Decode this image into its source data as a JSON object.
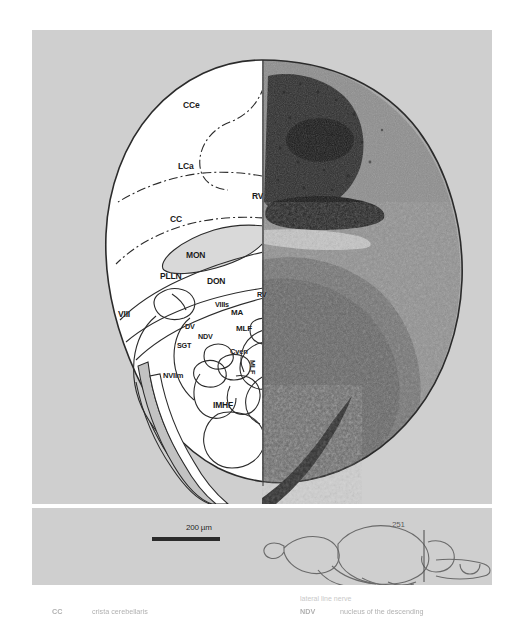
{
  "figure": {
    "panel_bg": "#cfcfcf",
    "page_bg": "#ffffff",
    "outline_color": "#2b2b2b",
    "traced_fill": "#ffffff",
    "histology_dark": "#4a4a4a"
  },
  "section_labels": [
    {
      "id": "CCe",
      "text": "CCe",
      "x": 183,
      "y": 101,
      "size": 8.5,
      "rotate": 0
    },
    {
      "id": "LCa",
      "text": "LCa",
      "x": 178,
      "y": 162,
      "size": 8.5,
      "rotate": 0
    },
    {
      "id": "RV1",
      "text": "RV",
      "x": 252,
      "y": 192,
      "size": 8.5,
      "rotate": 0
    },
    {
      "id": "CC",
      "text": "CC",
      "x": 170,
      "y": 215,
      "size": 8.5,
      "rotate": 0
    },
    {
      "id": "MON",
      "text": "MON",
      "x": 186,
      "y": 251,
      "size": 8.5,
      "rotate": 0
    },
    {
      "id": "PLLN",
      "text": "PLLN",
      "x": 160,
      "y": 272,
      "size": 8.5,
      "rotate": 0
    },
    {
      "id": "DON",
      "text": "DON",
      "x": 207,
      "y": 277,
      "size": 8.5,
      "rotate": 0
    },
    {
      "id": "VIII",
      "text": "VIII",
      "x": 118,
      "y": 310,
      "size": 8.5,
      "rotate": 0
    },
    {
      "id": "VIIIs",
      "text": "VIIIs",
      "x": 215,
      "y": 301,
      "size": 7.2,
      "rotate": 0
    },
    {
      "id": "RV2",
      "text": "RV",
      "x": 257,
      "y": 291,
      "size": 7.2,
      "rotate": 0
    },
    {
      "id": "MA",
      "text": "MA",
      "x": 231,
      "y": 309,
      "size": 8.0,
      "rotate": 0
    },
    {
      "id": "MLF1",
      "text": "MLF",
      "x": 236,
      "y": 325,
      "size": 8.0,
      "rotate": 0
    },
    {
      "id": "DV",
      "text": "DV",
      "x": 185,
      "y": 323,
      "size": 7.2,
      "rotate": 0
    },
    {
      "id": "NDV",
      "text": "NDV",
      "x": 198,
      "y": 333,
      "size": 7.2,
      "rotate": 0
    },
    {
      "id": "SGT",
      "text": "SGT",
      "x": 177,
      "y": 342,
      "size": 7.2,
      "rotate": 0
    },
    {
      "id": "Cven",
      "text": "Cven",
      "x": 230,
      "y": 348,
      "size": 7.5,
      "rotate": 0
    },
    {
      "id": "NVIIm",
      "text": "NVIIm",
      "x": 163,
      "y": 372,
      "size": 7.5,
      "rotate": 0
    },
    {
      "id": "MLF2",
      "text": "MLF",
      "x": 256,
      "y": 360,
      "size": 7.2,
      "rotate": 90
    },
    {
      "id": "IMHF",
      "text": "IMHF",
      "x": 213,
      "y": 401,
      "size": 8.5,
      "rotate": 0
    }
  ],
  "scale_bar": {
    "label": "200 µm",
    "label_x": 186,
    "label_y": 524,
    "bar_x": 152,
    "bar_y": 537,
    "bar_width": 68,
    "bar_height": 4
  },
  "inset": {
    "section_number": "251",
    "number_x": 392,
    "number_y": 521,
    "caption_u": "u"
  },
  "legend": {
    "left": [
      {
        "abbr": "CC",
        "term": "crista cerebellaris"
      }
    ],
    "right": [
      {
        "abbr": "NDV",
        "term": "nucleus of the descending"
      }
    ],
    "cut_line_1": "nucleus of the",
    "cut_line_2": "lateral line nerve"
  }
}
